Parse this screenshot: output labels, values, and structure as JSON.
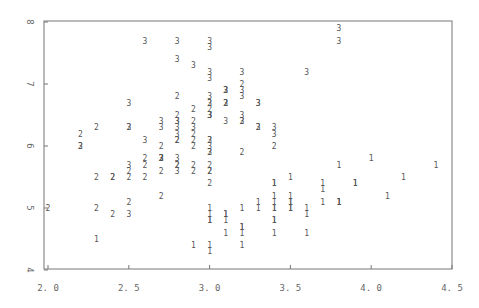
{
  "chart_data": {
    "type": "scatter",
    "title": "",
    "xlabel": "",
    "ylabel": "",
    "xlim": [
      2.0,
      4.5
    ],
    "ylim": [
      4,
      8
    ],
    "grid": false,
    "legend": "none (points plotted as class label characters 1, 2, 3)",
    "x_ticks": [
      "2.0",
      "2.5",
      "3.0",
      "3.5",
      "4.0",
      "4.5"
    ],
    "y_ticks": [
      "4",
      "5",
      "6",
      "7",
      "8"
    ],
    "marker_color": "#555555",
    "axis_color": "#777777",
    "series": [
      {
        "name": "1",
        "points": [
          [
            3.5,
            5.1
          ],
          [
            3.0,
            4.9
          ],
          [
            3.2,
            4.7
          ],
          [
            3.1,
            4.6
          ],
          [
            3.6,
            5.0
          ],
          [
            3.9,
            5.4
          ],
          [
            3.4,
            4.6
          ],
          [
            3.4,
            5.0
          ],
          [
            2.9,
            4.4
          ],
          [
            3.1,
            4.9
          ],
          [
            3.7,
            5.4
          ],
          [
            3.4,
            4.8
          ],
          [
            3.0,
            4.8
          ],
          [
            3.0,
            4.3
          ],
          [
            4.0,
            5.8
          ],
          [
            4.4,
            5.7
          ],
          [
            3.9,
            5.4
          ],
          [
            3.5,
            5.1
          ],
          [
            3.8,
            5.7
          ],
          [
            3.8,
            5.1
          ],
          [
            3.4,
            5.4
          ],
          [
            3.7,
            5.1
          ],
          [
            3.6,
            4.6
          ],
          [
            3.3,
            5.1
          ],
          [
            3.4,
            4.8
          ],
          [
            3.0,
            5.0
          ],
          [
            3.4,
            5.0
          ],
          [
            3.5,
            5.2
          ],
          [
            3.4,
            5.2
          ],
          [
            3.2,
            4.7
          ],
          [
            3.1,
            4.8
          ],
          [
            3.4,
            5.4
          ],
          [
            4.1,
            5.2
          ],
          [
            4.2,
            5.5
          ],
          [
            3.1,
            4.9
          ],
          [
            3.2,
            5.0
          ],
          [
            3.5,
            5.5
          ],
          [
            3.6,
            4.9
          ],
          [
            3.0,
            4.4
          ],
          [
            3.4,
            5.1
          ],
          [
            3.5,
            5.0
          ],
          [
            2.3,
            4.5
          ],
          [
            3.2,
            4.4
          ],
          [
            3.5,
            5.0
          ],
          [
            3.8,
            5.1
          ],
          [
            3.0,
            4.8
          ],
          [
            3.8,
            5.1
          ],
          [
            3.2,
            4.6
          ],
          [
            3.7,
            5.3
          ],
          [
            3.3,
            5.0
          ]
        ]
      },
      {
        "name": "2",
        "points": [
          [
            3.2,
            7.0
          ],
          [
            3.2,
            6.4
          ],
          [
            3.1,
            6.9
          ],
          [
            2.3,
            5.5
          ],
          [
            2.8,
            6.5
          ],
          [
            2.8,
            5.7
          ],
          [
            3.3,
            6.3
          ],
          [
            2.4,
            4.9
          ],
          [
            2.9,
            6.6
          ],
          [
            2.7,
            5.2
          ],
          [
            2.0,
            5.0
          ],
          [
            3.0,
            5.9
          ],
          [
            2.2,
            6.0
          ],
          [
            2.9,
            6.1
          ],
          [
            2.9,
            5.6
          ],
          [
            3.1,
            6.7
          ],
          [
            3.0,
            5.6
          ],
          [
            2.7,
            5.8
          ],
          [
            2.2,
            6.2
          ],
          [
            2.5,
            5.6
          ],
          [
            3.2,
            5.9
          ],
          [
            2.8,
            6.1
          ],
          [
            2.5,
            6.3
          ],
          [
            2.8,
            6.1
          ],
          [
            2.9,
            6.4
          ],
          [
            3.0,
            6.6
          ],
          [
            2.8,
            6.8
          ],
          [
            3.0,
            6.7
          ],
          [
            2.9,
            6.0
          ],
          [
            2.6,
            5.7
          ],
          [
            2.4,
            5.5
          ],
          [
            2.4,
            5.5
          ],
          [
            2.7,
            5.8
          ],
          [
            2.7,
            6.0
          ],
          [
            3.0,
            5.4
          ],
          [
            3.4,
            6.0
          ],
          [
            3.1,
            6.7
          ],
          [
            2.3,
            6.3
          ],
          [
            3.0,
            5.6
          ],
          [
            2.5,
            5.5
          ],
          [
            2.6,
            5.5
          ],
          [
            3.0,
            6.1
          ],
          [
            2.6,
            5.8
          ],
          [
            2.3,
            5.0
          ],
          [
            2.7,
            5.6
          ],
          [
            3.0,
            5.7
          ],
          [
            2.9,
            5.7
          ],
          [
            2.9,
            6.2
          ],
          [
            2.5,
            5.1
          ],
          [
            2.8,
            5.7
          ]
        ]
      },
      {
        "name": "3",
        "points": [
          [
            3.3,
            6.3
          ],
          [
            2.7,
            5.8
          ],
          [
            3.0,
            7.1
          ],
          [
            2.9,
            6.3
          ],
          [
            3.0,
            6.5
          ],
          [
            3.0,
            7.6
          ],
          [
            2.5,
            4.9
          ],
          [
            2.9,
            7.3
          ],
          [
            2.5,
            6.7
          ],
          [
            3.6,
            7.2
          ],
          [
            3.2,
            6.5
          ],
          [
            2.7,
            6.4
          ],
          [
            3.0,
            6.8
          ],
          [
            2.5,
            5.7
          ],
          [
            2.8,
            5.8
          ],
          [
            3.2,
            6.4
          ],
          [
            3.0,
            6.5
          ],
          [
            3.8,
            7.7
          ],
          [
            2.6,
            7.7
          ],
          [
            2.2,
            6.0
          ],
          [
            3.2,
            6.9
          ],
          [
            2.8,
            5.6
          ],
          [
            2.8,
            7.7
          ],
          [
            2.7,
            6.3
          ],
          [
            3.3,
            6.7
          ],
          [
            3.2,
            7.2
          ],
          [
            2.8,
            6.2
          ],
          [
            3.0,
            6.1
          ],
          [
            2.8,
            6.4
          ],
          [
            3.0,
            7.2
          ],
          [
            2.8,
            7.4
          ],
          [
            3.8,
            7.9
          ],
          [
            2.8,
            6.4
          ],
          [
            2.8,
            6.3
          ],
          [
            2.6,
            6.1
          ],
          [
            3.0,
            7.7
          ],
          [
            3.4,
            6.3
          ],
          [
            3.1,
            6.4
          ],
          [
            3.0,
            6.0
          ],
          [
            3.1,
            6.9
          ],
          [
            3.1,
            6.7
          ],
          [
            3.1,
            6.9
          ],
          [
            2.7,
            5.8
          ],
          [
            3.2,
            6.8
          ],
          [
            3.3,
            6.7
          ],
          [
            3.0,
            6.7
          ],
          [
            2.5,
            6.3
          ],
          [
            3.0,
            6.5
          ],
          [
            3.4,
            6.2
          ],
          [
            3.0,
            5.9
          ]
        ]
      }
    ]
  }
}
